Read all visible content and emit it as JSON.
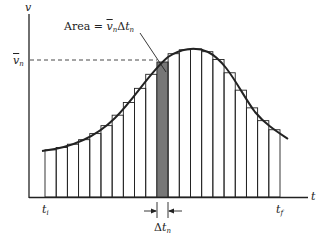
{
  "diagram": {
    "type": "riemann-sum-velocity-time",
    "axes": {
      "y_label": "v",
      "x_label": "t"
    },
    "labels": {
      "vbar_n": "v",
      "vbar_n_sub": "n",
      "area_prefix": "Area = ",
      "area_v": "v",
      "area_v_sub": "n",
      "area_delta": "Δ",
      "area_t": "t",
      "area_t_sub": "n",
      "t_initial": "t",
      "t_initial_sub": "i",
      "t_final": "t",
      "t_final_sub": "f",
      "delta": "Δ",
      "delta_t": "t",
      "delta_t_sub": "n"
    },
    "colors": {
      "line": "#222222",
      "shaded_bar": "#777777",
      "background": "#ffffff"
    },
    "bar_count": 21,
    "shaded_bar_index": 10
  }
}
